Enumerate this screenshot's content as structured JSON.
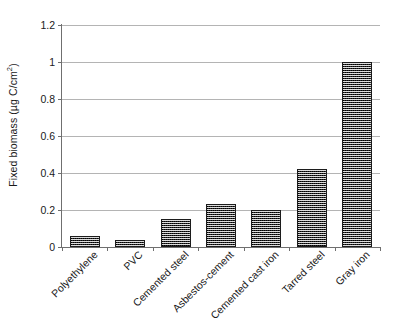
{
  "chart_data": {
    "type": "bar",
    "title": "",
    "subtitle": "",
    "xlabel": "",
    "ylabel": "Fixed biomass (µg C/cm²)",
    "ylabel_prefix": "Fixed biomass (µg C/cm",
    "ylabel_exponent": "2",
    "ylabel_suffix": ")",
    "categories": [
      "Polyethylene",
      "PVC",
      "Cemented steel",
      "Asbestos-cement",
      "Cemented cast iron",
      "Tarred steel",
      "Gray iron"
    ],
    "values": [
      0.06,
      0.04,
      0.15,
      0.23,
      0.2,
      0.42,
      1.0
    ],
    "ylim": [
      0,
      1.2
    ],
    "yticks": [
      0,
      0.2,
      0.4,
      0.6,
      0.8,
      1,
      1.2
    ],
    "ytick_labels": [
      "0",
      "0.2",
      "0.4",
      "0.6",
      "0.8",
      "1",
      "1.2"
    ],
    "grid": "horizontal",
    "legend": "none",
    "bar_color": "#2b2b2b",
    "bar_pattern": "dense-checkerboard",
    "gridline_color": "#b4b4b4",
    "axis_color": "#6f6f6f",
    "background_color": "#ffffff",
    "xtick_label_rotation": -45
  }
}
